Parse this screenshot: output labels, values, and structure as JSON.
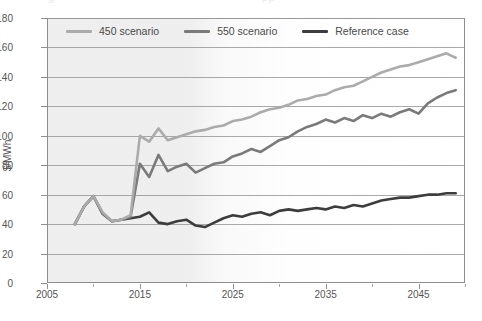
{
  "chart_data": {
    "type": "line",
    "title": "",
    "xlabel": "",
    "ylabel": "$/MWh",
    "xlim": [
      2005,
      2050
    ],
    "ylim": [
      0,
      180
    ],
    "grid": true,
    "legend_position": "top-inside",
    "x_ticks": [
      "2005",
      "2015",
      "2025",
      "2035",
      "2045"
    ],
    "x_tick_values": [
      2005,
      2015,
      2025,
      2035,
      2045
    ],
    "y_ticks": [
      "0",
      "20",
      "40",
      "60",
      "80",
      "100",
      "120",
      "140",
      "160",
      "180"
    ],
    "y_tick_values": [
      0,
      20,
      40,
      60,
      80,
      100,
      120,
      140,
      160,
      180
    ],
    "x": [
      2008,
      2009,
      2010,
      2011,
      2012,
      2013,
      2014,
      2015,
      2016,
      2017,
      2018,
      2019,
      2020,
      2021,
      2022,
      2023,
      2024,
      2025,
      2026,
      2027,
      2028,
      2029,
      2030,
      2031,
      2032,
      2033,
      2034,
      2035,
      2036,
      2037,
      2038,
      2039,
      2040,
      2041,
      2042,
      2043,
      2044,
      2045,
      2046,
      2047,
      2048,
      2049
    ],
    "series": [
      {
        "name": "450 scenario",
        "color": "#ababab",
        "values": [
          40,
          52,
          59,
          48,
          42,
          43,
          46,
          100,
          96,
          105,
          97,
          99,
          101,
          103,
          104,
          106,
          107,
          110,
          111,
          113,
          116,
          118,
          119,
          121,
          124,
          125,
          127,
          128,
          131,
          133,
          134,
          137,
          140,
          143,
          145,
          147,
          148,
          150,
          152,
          154,
          156,
          153
        ]
      },
      {
        "name": "550 scenario",
        "color": "#7a7a7a",
        "values": [
          40,
          52,
          59,
          47,
          42,
          43,
          45,
          81,
          72,
          87,
          76,
          79,
          81,
          75,
          78,
          81,
          82,
          86,
          88,
          91,
          89,
          93,
          97,
          99,
          103,
          106,
          108,
          111,
          109,
          112,
          110,
          114,
          112,
          115,
          113,
          116,
          118,
          115,
          122,
          126,
          129,
          131
        ]
      },
      {
        "name": "Reference case",
        "color": "#3d3d3d",
        "values": [
          40,
          52,
          59,
          47,
          42,
          43,
          44,
          45,
          48,
          41,
          40,
          42,
          43,
          39,
          38,
          41,
          44,
          46,
          45,
          47,
          48,
          46,
          49,
          50,
          49,
          50,
          51,
          50,
          52,
          51,
          53,
          52,
          54,
          56,
          57,
          58,
          58,
          59,
          60,
          60,
          61,
          61
        ]
      }
    ]
  },
  "legend": {
    "items": [
      {
        "label": "450 scenario",
        "color": "#ababab"
      },
      {
        "label": "550 scenario",
        "color": "#7a7a7a"
      },
      {
        "label": "Reference case",
        "color": "#3d3d3d"
      }
    ]
  },
  "axes": {
    "y_title": "$/MWh"
  },
  "title_remnant": {
    "left": "g",
    "right": "pp"
  }
}
